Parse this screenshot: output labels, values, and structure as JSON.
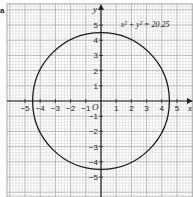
{
  "part_label": "a",
  "chart_data": {
    "type": "line",
    "title": "",
    "equation_label": "x² + y² = 20.25",
    "xlabel": "x",
    "ylabel": "y",
    "origin_label": "O",
    "xlim": [
      -6.2,
      6.0
    ],
    "ylim": [
      -6.4,
      6.4
    ],
    "x_ticks": [
      -5,
      -4,
      -3,
      -2,
      -1,
      1,
      2,
      3,
      4,
      5
    ],
    "y_ticks": [
      -5,
      -4,
      -3,
      -2,
      -1,
      1,
      2,
      3,
      4,
      5
    ],
    "grid": true,
    "grid_minor_step": 0.2,
    "grid_major_step": 1,
    "series": [
      {
        "name": "x² + y² = 20.25",
        "shape": "circle",
        "center": [
          0,
          0
        ],
        "radius": 4.5
      }
    ]
  },
  "layout": {
    "origin_px": [
      101,
      101
    ],
    "unit_px": 15.2,
    "grid_left_px": 7,
    "grid_top_px": 4,
    "grid_right_px": 193,
    "grid_bottom_px": 197,
    "colors": {
      "grid_minor": "#d4d4d4",
      "grid_major": "#a8a8a8",
      "axis": "#222222",
      "curve": "#1a1a1a",
      "text": "#222222"
    }
  }
}
